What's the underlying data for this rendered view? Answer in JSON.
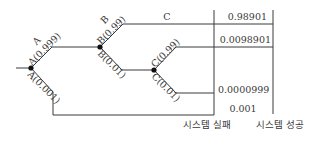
{
  "diagram": {
    "type": "event-tree",
    "nodes": {
      "A": {
        "name": "A",
        "success_label": "A(0.999)",
        "failure_label": "A(0.001)"
      },
      "B": {
        "name": "B",
        "success_label": "B(0.99)",
        "failure_label": "B(0.01)"
      },
      "C": {
        "name": "C",
        "success_label": "C(0.99)",
        "failure_label": "C(0.01)"
      }
    },
    "top_branch_label": "C",
    "outcomes": [
      {
        "value": "0.98901",
        "column": "system_success"
      },
      {
        "value": "0.0098901",
        "column": "system_success"
      },
      {
        "value": "0.0000999",
        "column": "system_failure"
      },
      {
        "value": "0.001",
        "column": "system_failure"
      }
    ],
    "columns": {
      "failure": "시스템 실패",
      "success": "시스템 성공"
    },
    "colors": {
      "line": "#3a3a3a",
      "node": "#111111"
    }
  }
}
